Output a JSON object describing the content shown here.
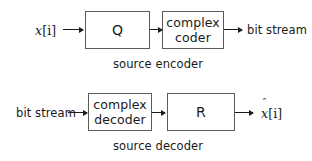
{
  "diagram": {
    "type": "block-diagram",
    "background_color": "#ffffff",
    "line_color": "#1a1a1a",
    "box_border_color": "#5a5a5a",
    "rows": [
      {
        "id": "source-encoder",
        "caption": "source encoder",
        "input_label": "x[i]",
        "output_label": "bit stream",
        "blocks": [
          {
            "id": "quantizer",
            "lines": [
              "Q"
            ]
          },
          {
            "id": "complex-coder",
            "lines": [
              "complex",
              "coder"
            ]
          }
        ]
      },
      {
        "id": "source-decoder",
        "caption": "source decoder",
        "input_label": "bit stream",
        "output_label": "x̂[i]",
        "blocks": [
          {
            "id": "complex-decoder",
            "lines": [
              "complex",
              "decoder"
            ]
          },
          {
            "id": "reconstructor",
            "lines": [
              "R"
            ]
          }
        ]
      }
    ]
  },
  "labels": {
    "x_base": "x",
    "x_index": "[i]",
    "xhat_accent": "ˆ",
    "bit_stream": "bit stream",
    "q": "Q",
    "r": "R",
    "complex": "complex",
    "coder": "coder",
    "decoder": "decoder",
    "source_encoder": "source encoder",
    "source_decoder": "source decoder"
  }
}
